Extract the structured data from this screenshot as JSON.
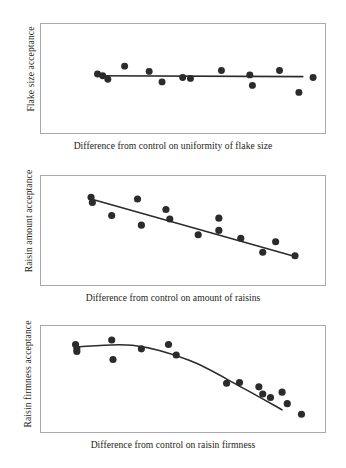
{
  "figure": {
    "background_color": "#ffffff",
    "ink_color": "#231f20",
    "frame_color": "#a9a9a9",
    "marker_color": "#2b2b2b",
    "fit_line_color": "#2b2b2b"
  },
  "chart_data": [
    {
      "type": "scatter",
      "title": "",
      "xlabel": "Difference from control on uniformity of flake size",
      "ylabel": "Flake size acceptance",
      "xlim": [
        0,
        100
      ],
      "ylim": [
        0,
        100
      ],
      "grid": false,
      "legend": "none",
      "axis_ticks": false,
      "trend": {
        "kind": "linear",
        "description": "flat, no relationship",
        "x": [
          16,
          96
        ],
        "y": [
          52,
          51
        ]
      },
      "points": [
        {
          "x": 16.5,
          "y": 54
        },
        {
          "x": 18.5,
          "y": 52
        },
        {
          "x": 20.5,
          "y": 48
        },
        {
          "x": 27.0,
          "y": 63
        },
        {
          "x": 36.5,
          "y": 57
        },
        {
          "x": 41.5,
          "y": 45
        },
        {
          "x": 49.5,
          "y": 50
        },
        {
          "x": 52.5,
          "y": 49
        },
        {
          "x": 64.5,
          "y": 58
        },
        {
          "x": 75.5,
          "y": 53
        },
        {
          "x": 76.5,
          "y": 41
        },
        {
          "x": 87.0,
          "y": 58
        },
        {
          "x": 94.5,
          "y": 33
        },
        {
          "x": 100.0,
          "y": 50
        },
        {
          "x": 110.0,
          "y": 60
        }
      ]
    },
    {
      "type": "scatter",
      "title": "",
      "xlabel": "Difference from control on amount of raisins",
      "ylabel": "Raisin amount acceptance",
      "xlim": [
        0,
        100
      ],
      "ylim": [
        0,
        100
      ],
      "grid": false,
      "legend": "none",
      "axis_ticks": false,
      "trend": {
        "kind": "linear",
        "description": "strong negative linear relationship",
        "x": [
          14,
          93
        ],
        "y": [
          85,
          19
        ]
      },
      "points": [
        {
          "x": 14.0,
          "y": 87
        },
        {
          "x": 14.5,
          "y": 81
        },
        {
          "x": 22.0,
          "y": 66
        },
        {
          "x": 32.0,
          "y": 85
        },
        {
          "x": 33.5,
          "y": 55
        },
        {
          "x": 43.0,
          "y": 73
        },
        {
          "x": 44.5,
          "y": 62
        },
        {
          "x": 55.5,
          "y": 44
        },
        {
          "x": 63.5,
          "y": 63
        },
        {
          "x": 63.5,
          "y": 49
        },
        {
          "x": 72.0,
          "y": 40
        },
        {
          "x": 80.5,
          "y": 24
        },
        {
          "x": 85.5,
          "y": 36
        },
        {
          "x": 93.0,
          "y": 20
        }
      ]
    },
    {
      "type": "scatter",
      "title": "",
      "xlabel": "Difference from control on raisin firmness",
      "ylabel": "Raisin firmness acceptance",
      "xlim": [
        0,
        100
      ],
      "ylim": [
        0,
        100
      ],
      "grid": false,
      "legend": "none",
      "axis_ticks": false,
      "trend": {
        "kind": "quadratic",
        "description": "curvilinear, plateau then steep decline",
        "x": [
          8,
          30,
          52,
          72,
          88
        ],
        "y": [
          85,
          87,
          70,
          40,
          14
        ]
      },
      "points": [
        {
          "x": 8.0,
          "y": 88
        },
        {
          "x": 8.5,
          "y": 83
        },
        {
          "x": 8.5,
          "y": 80
        },
        {
          "x": 22.0,
          "y": 93
        },
        {
          "x": 22.5,
          "y": 71
        },
        {
          "x": 33.5,
          "y": 83
        },
        {
          "x": 44.0,
          "y": 88
        },
        {
          "x": 47.0,
          "y": 76
        },
        {
          "x": 66.5,
          "y": 44
        },
        {
          "x": 71.5,
          "y": 45
        },
        {
          "x": 79.0,
          "y": 40
        },
        {
          "x": 80.5,
          "y": 32
        },
        {
          "x": 83.5,
          "y": 28
        },
        {
          "x": 88.0,
          "y": 34
        },
        {
          "x": 90.0,
          "y": 21
        },
        {
          "x": 95.5,
          "y": 9
        }
      ]
    }
  ],
  "panels": [
    {
      "name": "flake-size",
      "ylabel": "Flake size acceptance",
      "xlabel": "Difference from control on uniformity of flake size"
    },
    {
      "name": "raisin-amount",
      "ylabel": "Raisin amount acceptance",
      "xlabel": "Difference from control on amount of raisins"
    },
    {
      "name": "raisin-firmness",
      "ylabel": "Raisin firmness acceptance",
      "xlabel": "Difference from control on raisin firmness"
    }
  ]
}
